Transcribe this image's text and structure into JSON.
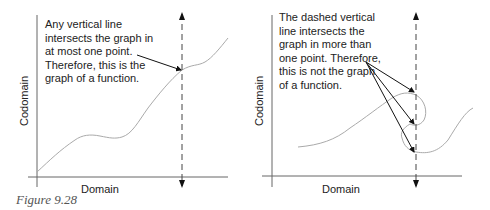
{
  "figure": {
    "caption": "Figure 9.28",
    "left_panel": {
      "x_label": "Domain",
      "y_label": "Codomain",
      "annotation": [
        "Any vertical line",
        "intersects the graph in",
        "at most one point.",
        "Therefore, this is the",
        "graph of a function."
      ]
    },
    "right_panel": {
      "x_label": "Domain",
      "y_label": "Codomain",
      "annotation": [
        "The dashed vertical",
        "line intersects the",
        "graph in more than",
        "one point. Therefore,",
        "this is not the graph",
        "of a function."
      ]
    }
  }
}
